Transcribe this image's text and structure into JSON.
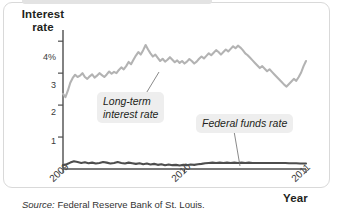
{
  "figure": {
    "source_lead": "Source:",
    "source_text": " Federal Reserve Bank of St. Louis."
  },
  "chart_data": {
    "type": "line",
    "title": "",
    "xlabel": "Year",
    "ylabel": "Interest rate",
    "ylabel_line1": "Interest",
    "ylabel_line2": "rate",
    "xlim": [
      2009.0,
      2011.0
    ],
    "ylim": [
      0,
      4.35
    ],
    "grid": false,
    "legend_position": "inline-annotations",
    "ytick_labels": [
      "4%",
      "3",
      "2",
      "1"
    ],
    "ytick_values": [
      4,
      3,
      2,
      1
    ],
    "xtick_labels": [
      "2009",
      "2010",
      "2011"
    ],
    "xtick_values": [
      2009,
      2010,
      2011
    ],
    "annotations": [
      {
        "name": "long-term-interest-rate",
        "text_line1": "Long-term",
        "text_line2": "interest rate",
        "points_to_x": 2009.62,
        "points_to_y": 3.32
      },
      {
        "name": "federal-funds-rate",
        "text_line1": "Federal funds rate",
        "text_line2": "",
        "points_to_x": 2010.55,
        "points_to_y": 0.18
      }
    ],
    "series": [
      {
        "name": "Long-term interest rate",
        "color": "#b3b3b3",
        "x": [
          2009.0,
          2009.02,
          2009.04,
          2009.06,
          2009.08,
          2009.1,
          2009.12,
          2009.14,
          2009.16,
          2009.18,
          2009.2,
          2009.22,
          2009.24,
          2009.26,
          2009.28,
          2009.3,
          2009.32,
          2009.34,
          2009.36,
          2009.38,
          2009.4,
          2009.42,
          2009.44,
          2009.46,
          2009.48,
          2009.5,
          2009.52,
          2009.54,
          2009.56,
          2009.58,
          2009.6,
          2009.62,
          2009.64,
          2009.66,
          2009.68,
          2009.7,
          2009.72,
          2009.74,
          2009.76,
          2009.78,
          2009.8,
          2009.82,
          2009.84,
          2009.86,
          2009.88,
          2009.9,
          2009.92,
          2009.94,
          2009.96,
          2009.98,
          2010.0,
          2010.02,
          2010.04,
          2010.06,
          2010.08,
          2010.1,
          2010.12,
          2010.14,
          2010.16,
          2010.18,
          2010.2,
          2010.22,
          2010.24,
          2010.26,
          2010.28,
          2010.3,
          2010.32,
          2010.34,
          2010.36,
          2010.38,
          2010.4,
          2010.42,
          2010.44,
          2010.46,
          2010.48,
          2010.5,
          2010.52,
          2010.54,
          2010.56,
          2010.58,
          2010.6,
          2010.62,
          2010.64,
          2010.66,
          2010.68,
          2010.7,
          2010.72,
          2010.74,
          2010.76,
          2010.78,
          2010.8,
          2010.82,
          2010.84,
          2010.86,
          2010.88,
          2010.9,
          2010.92,
          2010.94,
          2010.96,
          2010.98,
          2011.0
        ],
        "y": [
          2.35,
          2.25,
          2.45,
          2.7,
          2.85,
          2.95,
          2.88,
          2.92,
          3.0,
          2.88,
          2.82,
          2.9,
          2.96,
          2.86,
          2.92,
          3.0,
          2.94,
          2.88,
          2.96,
          3.05,
          2.98,
          3.04,
          3.0,
          3.1,
          3.18,
          3.12,
          3.22,
          3.35,
          3.28,
          3.42,
          3.55,
          3.66,
          3.58,
          3.72,
          3.88,
          3.74,
          3.62,
          3.52,
          3.58,
          3.48,
          3.38,
          3.45,
          3.36,
          3.42,
          3.5,
          3.42,
          3.34,
          3.4,
          3.32,
          3.38,
          3.3,
          3.36,
          3.44,
          3.38,
          3.3,
          3.36,
          3.45,
          3.52,
          3.46,
          3.54,
          3.62,
          3.56,
          3.64,
          3.72,
          3.66,
          3.58,
          3.66,
          3.74,
          3.68,
          3.76,
          3.84,
          3.78,
          3.86,
          3.8,
          3.72,
          3.62,
          3.56,
          3.48,
          3.4,
          3.32,
          3.24,
          3.16,
          3.22,
          3.14,
          3.06,
          3.12,
          3.04,
          2.96,
          2.88,
          2.8,
          2.72,
          2.64,
          2.58,
          2.66,
          2.74,
          2.82,
          2.76,
          2.88,
          3.02,
          3.22,
          3.38
        ]
      },
      {
        "name": "Federal funds rate",
        "color": "#4d4d4d",
        "x": [
          2009.0,
          2009.03,
          2009.06,
          2009.09,
          2009.12,
          2009.15,
          2009.18,
          2009.21,
          2009.24,
          2009.27,
          2009.3,
          2009.33,
          2009.36,
          2009.39,
          2009.42,
          2009.45,
          2009.48,
          2009.51,
          2009.54,
          2009.57,
          2009.6,
          2009.63,
          2009.66,
          2009.69,
          2009.72,
          2009.75,
          2009.78,
          2009.81,
          2009.84,
          2009.87,
          2009.9,
          2009.93,
          2009.96,
          2009.99,
          2010.02,
          2010.05,
          2010.08,
          2010.11,
          2010.14,
          2010.17,
          2010.2,
          2010.23,
          2010.26,
          2010.29,
          2010.32,
          2010.35,
          2010.38,
          2010.41,
          2010.44,
          2010.47,
          2010.5,
          2010.53,
          2010.56,
          2010.59,
          2010.62,
          2010.65,
          2010.68,
          2010.71,
          2010.74,
          2010.77,
          2010.8,
          2010.83,
          2010.86,
          2010.89,
          2010.92,
          2010.95,
          2010.98,
          2011.0
        ],
        "y": [
          0.12,
          0.15,
          0.2,
          0.24,
          0.22,
          0.19,
          0.21,
          0.18,
          0.2,
          0.17,
          0.19,
          0.22,
          0.2,
          0.17,
          0.19,
          0.22,
          0.19,
          0.17,
          0.2,
          0.18,
          0.16,
          0.18,
          0.15,
          0.17,
          0.14,
          0.16,
          0.13,
          0.15,
          0.12,
          0.14,
          0.12,
          0.13,
          0.11,
          0.13,
          0.12,
          0.14,
          0.13,
          0.15,
          0.16,
          0.18,
          0.19,
          0.2,
          0.19,
          0.2,
          0.19,
          0.2,
          0.19,
          0.2,
          0.19,
          0.2,
          0.19,
          0.2,
          0.19,
          0.19,
          0.19,
          0.19,
          0.19,
          0.19,
          0.19,
          0.19,
          0.19,
          0.19,
          0.18,
          0.18,
          0.18,
          0.17,
          0.17,
          0.17
        ]
      }
    ]
  }
}
